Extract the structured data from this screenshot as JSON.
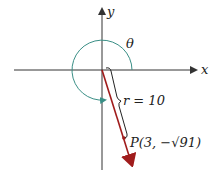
{
  "diagram": {
    "axes": {
      "x_label": "x",
      "y_label": "y"
    },
    "angle": {
      "label": "θ",
      "color": "#3a8f86"
    },
    "radius": {
      "label": "r = 10",
      "value": 10
    },
    "point": {
      "label": "P(3, −√91)",
      "x": 3,
      "y_expr": "−√91"
    },
    "colors": {
      "vector": "#a01c1c",
      "axes": "#333333",
      "arc": "#3a8f86"
    }
  }
}
